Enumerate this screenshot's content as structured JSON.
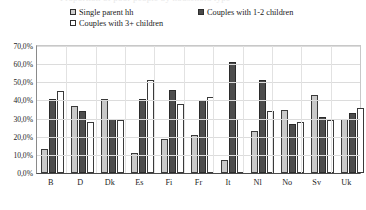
{
  "title_cut": "Proportion of poor people by household type",
  "legend": {
    "items": [
      {
        "label": "Single parent hh",
        "swatch": "light-gray",
        "color": "#cfcfcf"
      },
      {
        "label": "Couples with 1-2 children",
        "swatch": "dark-gray",
        "color": "#4a4a4a"
      },
      {
        "label": "Couples with 3+ children",
        "swatch": "white",
        "color": "#ffffff"
      }
    ]
  },
  "axis": {
    "y_ticks": [
      "70,0%",
      "60,0%",
      "50,0%",
      "40,0%",
      "30,0%",
      "20,0%",
      "10,0%",
      "0,0%"
    ]
  },
  "chart_data": {
    "type": "bar",
    "title": "Proportion of poor people by household type",
    "xlabel": "",
    "ylabel": "",
    "ylim": [
      0,
      70
    ],
    "ytick_values": [
      0,
      10,
      20,
      30,
      40,
      50,
      60,
      70
    ],
    "ytick_labels": [
      "0,0%",
      "10,0%",
      "20,0%",
      "30,0%",
      "40,0%",
      "50,0%",
      "60,0%",
      "70,0%"
    ],
    "grid": true,
    "legend_position": "top",
    "categories": [
      "B",
      "D",
      "Dk",
      "Es",
      "Fi",
      "Fr",
      "It",
      "Nl",
      "No",
      "Sv",
      "Uk"
    ],
    "series": [
      {
        "name": "Single parent hh",
        "color": "#cfcfcf",
        "values": [
          13,
          37,
          41,
          11,
          19,
          21,
          7,
          23,
          35,
          43,
          30
        ]
      },
      {
        "name": "Couples with 1-2 children",
        "color": "#4a4a4a",
        "values": [
          41,
          34,
          30,
          41,
          46,
          40,
          61,
          51,
          27,
          31,
          33
        ]
      },
      {
        "name": "Couples with 3+ children",
        "color": "#ffffff",
        "values": [
          45,
          28,
          29,
          51,
          38,
          42,
          30,
          34,
          28,
          29,
          36
        ]
      }
    ]
  }
}
